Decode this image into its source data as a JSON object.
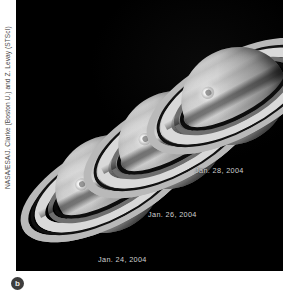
{
  "figure": {
    "panel_letter": "b",
    "credit": "NASA/ESA/J. Clarke (Boston U.) and Z. Levay (STScI)"
  },
  "image_panel": {
    "background_color": "#000000",
    "subject": "saturn-aurora-sequence",
    "observations": [
      {
        "id": "saturn-jan-24",
        "date_label": "Jan. 24, 2004",
        "aurora_label": "southern-aurora-bright-spot"
      },
      {
        "id": "saturn-jan-26",
        "date_label": "Jan. 26, 2004",
        "aurora_label": "southern-aurora-bright-spot"
      },
      {
        "id": "saturn-jan-28",
        "date_label": "Jan. 28, 2004",
        "aurora_label": "southern-aurora-bright-spot"
      }
    ],
    "colors": {
      "space": "#000000",
      "ring_bright": "#d9d9d9",
      "ring_outer": "#b9b9b9",
      "ring_faint": "#6e6e6e",
      "cassini_division": "#111111",
      "globe_light": "#d7d7d7",
      "globe_dark": "#5e5e5e",
      "aurora": "#ffffff",
      "caption_text": "#cfcfcf",
      "credit_text": "#4a4a4a",
      "badge_fill": "#3d3d3d"
    }
  }
}
